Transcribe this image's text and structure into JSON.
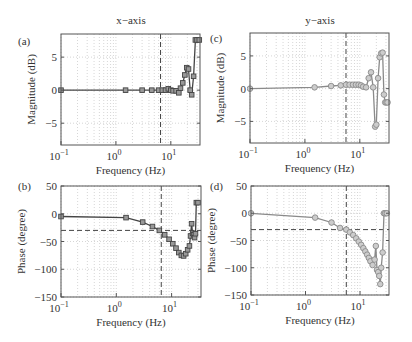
{
  "figure": {
    "column_titles": [
      "x−axis",
      "y−axis"
    ]
  },
  "chart_data": [
    {
      "id": "a",
      "panel_label": "(a)",
      "type": "line",
      "title": "x−axis",
      "xlabel": "Frequency (Hz)",
      "ylabel": "Magnitude (dB)",
      "xscale": "log",
      "xlim": [
        0.1,
        34
      ],
      "ylim": [
        -8.3,
        8.5
      ],
      "xticks": [
        0.1,
        1,
        10
      ],
      "xtick_labels": [
        "10^-1",
        "10^0",
        "10^1"
      ],
      "yticks": [
        -5,
        0,
        5
      ],
      "ytick_labels": [
        "−5",
        "0",
        "5"
      ],
      "grid": "dotted",
      "marker": "square",
      "color": "#444444",
      "vline": 6.5,
      "hline": null,
      "x": [
        0.1,
        1.5,
        3,
        4.5,
        6,
        7,
        8,
        9,
        10,
        11,
        12.5,
        14,
        15,
        16.5,
        18,
        19.5,
        21,
        22.5,
        24,
        26,
        28,
        30,
        33
      ],
      "y": [
        0,
        0,
        0,
        0,
        0,
        0,
        0,
        0.2,
        0,
        -0.1,
        -0.1,
        -0.4,
        0.3,
        1.1,
        2.3,
        3.4,
        3.2,
        0,
        -0.7,
        2.1,
        7.6,
        7.6,
        7.6
      ]
    },
    {
      "id": "b",
      "panel_label": "(b)",
      "type": "line",
      "title": "",
      "xlabel": "Frequency (Hz)",
      "ylabel": "Phase (degree)",
      "xscale": "log",
      "xlim": [
        0.1,
        34
      ],
      "ylim": [
        -150,
        50
      ],
      "xticks": [
        0.1,
        1,
        10
      ],
      "xtick_labels": [
        "10^-1",
        "10^0",
        "10^1"
      ],
      "yticks": [
        -150,
        -100,
        -50,
        0,
        50
      ],
      "ytick_labels": [
        "−150",
        "−100",
        "−50",
        "0",
        "50"
      ],
      "grid": "dotted",
      "marker": "square",
      "color": "#444444",
      "vline": 6.5,
      "hline": -30,
      "x": [
        0.1,
        1.5,
        3,
        4.5,
        6,
        7.5,
        9,
        10.5,
        12,
        13.5,
        15,
        16.5,
        18,
        19.5,
        21,
        22,
        23,
        24,
        25,
        26,
        27,
        28,
        30
      ],
      "y": [
        -5,
        -7,
        -15,
        -23,
        -30,
        -38,
        -46,
        -54,
        -62,
        -70,
        -75,
        -76,
        -72,
        -65,
        -58,
        -40,
        -18,
        -35,
        -38,
        -43,
        -36,
        20,
        20
      ]
    },
    {
      "id": "c",
      "panel_label": "(c)",
      "type": "line",
      "title": "y−axis",
      "xlabel": "Frequency (Hz)",
      "ylabel": "Magnitude (dB)",
      "xscale": "log",
      "xlim": [
        0.1,
        34
      ],
      "ylim": [
        -8.3,
        8.5
      ],
      "xticks": [
        0.1,
        1,
        10
      ],
      "xtick_labels": [
        "10^-1",
        "10^0",
        "10^1"
      ],
      "yticks": [
        -5,
        0,
        5
      ],
      "ytick_labels": [
        "−5",
        "0",
        "5"
      ],
      "grid": "dotted",
      "marker": "circle",
      "color": "#8a8a8a",
      "vline": 5.6,
      "hline": null,
      "x": [
        0.1,
        1.5,
        3,
        4.5,
        5.6,
        6.5,
        7.5,
        8.5,
        9.5,
        10.5,
        11.5,
        13,
        14.5,
        16,
        17.5,
        19,
        20,
        21.5,
        23,
        24.5,
        26,
        27.5,
        29,
        30.5,
        32
      ],
      "y": [
        0,
        0.2,
        0.4,
        0.5,
        0.6,
        0.6,
        0.6,
        0.6,
        0.6,
        0.5,
        0.3,
        0.2,
        1.6,
        2.5,
        0.2,
        -5.8,
        -5.5,
        1.6,
        4.8,
        5.4,
        5.5,
        -0.9,
        -2.1,
        -2.1,
        -2.1
      ]
    },
    {
      "id": "d",
      "panel_label": "(d)",
      "type": "line",
      "title": "",
      "xlabel": "Frequency (Hz)",
      "ylabel": "Phase (degree)",
      "xscale": "log",
      "xlim": [
        0.1,
        34
      ],
      "ylim": [
        -150,
        50
      ],
      "xticks": [
        0.1,
        1,
        10
      ],
      "xtick_labels": [
        "10^-1",
        "10^0",
        "10^1"
      ],
      "yticks": [
        -150,
        -100,
        -50,
        0,
        50
      ],
      "ytick_labels": [
        "−150",
        "−100",
        "−50",
        "0",
        "50"
      ],
      "grid": "dotted",
      "marker": "circle",
      "color": "#8a8a8a",
      "vline": 5.6,
      "hline": -30,
      "x": [
        0.1,
        1.5,
        3,
        4.3,
        5.6,
        6.5,
        7.5,
        8.5,
        9.5,
        10.5,
        11.5,
        12.5,
        13.5,
        14.5,
        15.5,
        17,
        18.5,
        19.5,
        20.5,
        21.5,
        22.5,
        23.5,
        24.5,
        26,
        27.5,
        29,
        31
      ],
      "y": [
        0,
        -8,
        -17,
        -27,
        -30,
        -35,
        -40,
        -46,
        -52,
        -58,
        -64,
        -70,
        -76,
        -82,
        -88,
        -95,
        -85,
        -60,
        -104,
        -108,
        -115,
        -130,
        -100,
        -72,
        0,
        0,
        0
      ]
    }
  ]
}
